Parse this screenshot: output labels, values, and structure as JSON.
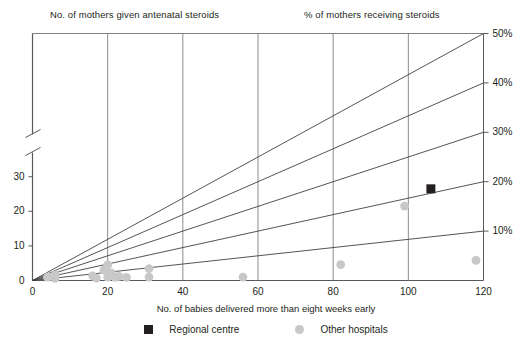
{
  "chart_data": {
    "type": "scatter",
    "title": "",
    "titles": {
      "left": "No. of mothers given antenatal steroids",
      "right": "% of mothers receiving steroids"
    },
    "xlabel": "No. of babies delivered more than eight weeks early",
    "ylabel": "",
    "xlim": [
      0,
      120
    ],
    "ylim": [
      0,
      37
    ],
    "xticks": [
      0,
      20,
      40,
      60,
      80,
      100,
      120
    ],
    "xticklabels": [
      "0",
      "20",
      "40",
      "60",
      "80",
      "100",
      "120"
    ],
    "yticks": [
      0,
      10,
      20,
      30
    ],
    "yticklabels": [
      "0",
      "10",
      "20",
      "30"
    ],
    "y_axis_break": true,
    "grid": "vertical",
    "right_axis_labels": [
      "10%",
      "20%",
      "30%",
      "40%",
      "50%"
    ],
    "right_axis_values": [
      10,
      20,
      30,
      40,
      50
    ],
    "reference_lines": [
      {
        "label": "10%",
        "slope_pct": 10
      },
      {
        "label": "20%",
        "slope_pct": 20
      },
      {
        "label": "30%",
        "slope_pct": 30
      },
      {
        "label": "40%",
        "slope_pct": 40
      },
      {
        "label": "50%",
        "slope_pct": 50
      }
    ],
    "legend": {
      "position": "bottom",
      "entries": [
        {
          "name": "Regional centre",
          "marker": "square",
          "color": "#231f20"
        },
        {
          "name": "Other hospitals",
          "marker": "circle",
          "color": "#c8c8c8"
        }
      ]
    },
    "series": [
      {
        "name": "Regional centre",
        "marker": "square",
        "color": "#231f20",
        "points": [
          {
            "x": 106,
            "y": 26.5
          }
        ]
      },
      {
        "name": "Other hospitals",
        "marker": "circle",
        "color": "#c8c8c8",
        "points": [
          {
            "x": 4,
            "y": 1.0
          },
          {
            "x": 6,
            "y": 0.6
          },
          {
            "x": 6,
            "y": 1.6
          },
          {
            "x": 16,
            "y": 1.3
          },
          {
            "x": 17,
            "y": 0.7
          },
          {
            "x": 19,
            "y": 3.0
          },
          {
            "x": 20,
            "y": 4.5
          },
          {
            "x": 20,
            "y": 1.0
          },
          {
            "x": 21,
            "y": 2.2
          },
          {
            "x": 22,
            "y": 0.9
          },
          {
            "x": 23,
            "y": 1.2
          },
          {
            "x": 25,
            "y": 0.9
          },
          {
            "x": 31,
            "y": 3.4
          },
          {
            "x": 31,
            "y": 1.0
          },
          {
            "x": 56,
            "y": 1.0
          },
          {
            "x": 82,
            "y": 4.6
          },
          {
            "x": 99,
            "y": 21.5
          },
          {
            "x": 118,
            "y": 5.8
          }
        ]
      }
    ]
  }
}
